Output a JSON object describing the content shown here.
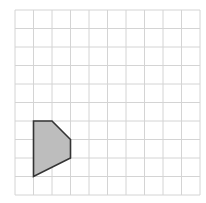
{
  "diagram": {
    "type": "grid-polygon",
    "grid": {
      "columns": 10,
      "rows": 10,
      "origin_px": [
        15,
        10
      ],
      "cell_px": 18.5,
      "line_color": "#d4d4d4"
    },
    "shape": {
      "name": "pentagon",
      "vertices_grid": [
        [
          1,
          6
        ],
        [
          2,
          6
        ],
        [
          3,
          7
        ],
        [
          3,
          8
        ],
        [
          1,
          9
        ]
      ],
      "fill": "#bdbdbd",
      "stroke": "#333333",
      "stroke_width": 1.6
    }
  }
}
